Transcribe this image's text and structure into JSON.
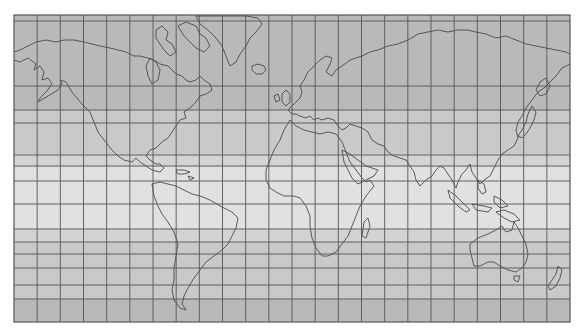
{
  "map": {
    "title": "World map (Mercator projection)",
    "projection": "Mercator",
    "meridian_count": 24,
    "meridian_spacing_deg": 15,
    "parallels_deg": [
      80,
      70,
      60,
      50,
      40,
      30,
      23.5,
      10,
      0,
      -10,
      -23.5,
      -30,
      -40,
      -50,
      -60,
      -70
    ],
    "zones": [
      {
        "name": "north-polar",
        "from_lat": 90,
        "to_lat": 50,
        "color": "#b9b9b9"
      },
      {
        "name": "north-temperate",
        "from_lat": 50,
        "to_lat": 30,
        "color": "#c9c9c9"
      },
      {
        "name": "north-subtropical",
        "from_lat": 30,
        "to_lat": 23.5,
        "color": "#d4d4d4"
      },
      {
        "name": "tropics",
        "from_lat": 23.5,
        "to_lat": -23.5,
        "color": "#e2e2e2"
      },
      {
        "name": "south-subtropical",
        "from_lat": -23.5,
        "to_lat": -30,
        "color": "#d4d4d4"
      },
      {
        "name": "south-temperate",
        "from_lat": -30,
        "to_lat": -55,
        "color": "#c9c9c9"
      },
      {
        "name": "south-polar",
        "from_lat": -55,
        "to_lat": -80,
        "color": "#b9b9b9"
      }
    ],
    "colors": {
      "background": "#ffffff",
      "gridline": "#555555",
      "coastline": "#4a4a4a"
    },
    "landmasses": [
      "North America",
      "Greenland",
      "South America",
      "Europe",
      "Africa",
      "Asia",
      "Australia",
      "New Zealand",
      "Japan",
      "Madagascar",
      "Iceland",
      "British Isles"
    ]
  }
}
